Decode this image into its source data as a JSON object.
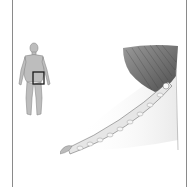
{
  "image": {
    "type": "anatomical-illustration",
    "description": "Medical illustration with body locator figure and detailed drawing of inguinal region showing muscle fibers and inguinal ligament",
    "locator_figure": {
      "icon": "human-body-front-icon",
      "highlight_region": "right-lower-abdomen-groin",
      "highlight_color": "#222222",
      "body_color": "#b8b8b8"
    },
    "main_drawing": {
      "subject": "inguinal-canal-anatomy",
      "muscle_color": "#6e6e6e",
      "tissue_color": "#d8d8d8"
    },
    "frame_color": "#8a8a8a",
    "background": "#ffffff"
  }
}
